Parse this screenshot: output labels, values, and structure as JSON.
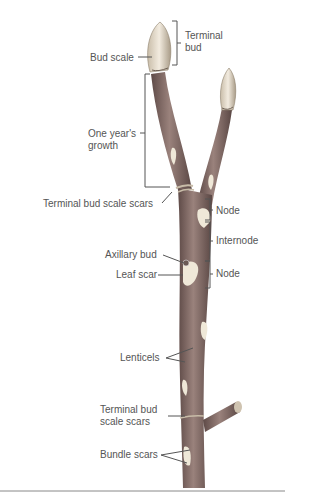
{
  "diagram": {
    "labels": {
      "terminal_bud": "Terminal\nbud",
      "terminal_bud_l1": "Terminal",
      "terminal_bud_l2": "bud",
      "bud_scale": "Bud scale",
      "one_years_growth_l1": "One year's",
      "one_years_growth_l2": "growth",
      "terminal_bud_scale_scars_top": "Terminal bud scale scars",
      "node_top": "Node",
      "internode": "Internode",
      "axillary_bud": "Axillary bud",
      "leaf_scar": "Leaf scar",
      "node_bottom": "Node",
      "lenticels": "Lenticels",
      "terminal_bud_scale_scars_bottom_l1": "Terminal bud",
      "terminal_bud_scale_scars_bottom_l2": "scale scars",
      "bundle_scars": "Bundle scars"
    },
    "colors": {
      "stem": "#8a6f6a",
      "stem_dark": "#5e4a47",
      "bud": "#e6dccd",
      "scar": "#efe8d8",
      "label_text": "#555555",
      "leader_line": "#555555",
      "rule": "#888888"
    }
  }
}
